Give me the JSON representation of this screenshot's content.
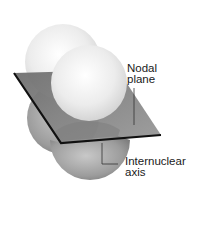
{
  "diagram": {
    "labels": {
      "nodal_plane": [
        "Nodal",
        "plane"
      ],
      "internuclear_axis": [
        "Internuclear",
        "axis"
      ]
    },
    "colors": {
      "upper_lobe": "#e8e8e8",
      "lower_lobe": "#9a9a9a",
      "plane": "#8c8c8c",
      "edge": "#111111",
      "background": "#ffffff"
    }
  }
}
